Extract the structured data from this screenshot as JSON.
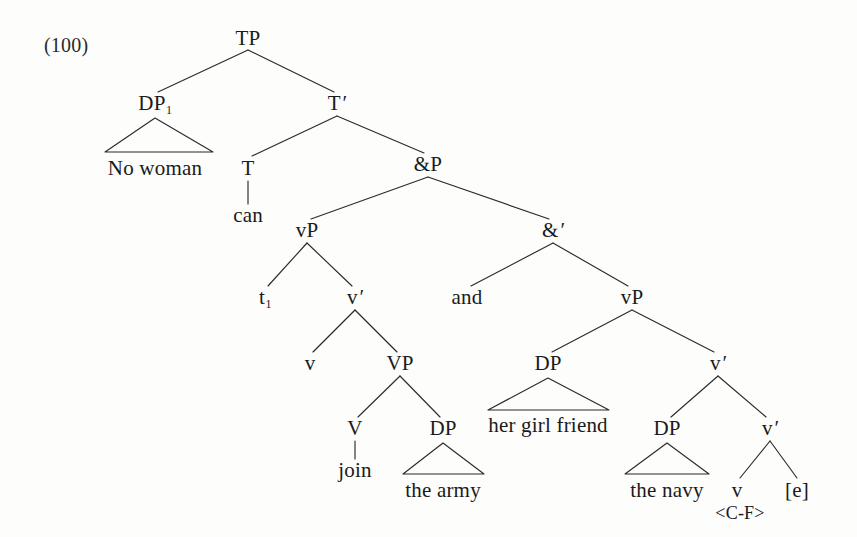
{
  "figure": {
    "example_number": "(100)",
    "kind": "syntax tree",
    "sentence": "No woman can join the army and her girl friend the navy"
  },
  "nodes": {
    "tp": "TP",
    "dp1": "DP",
    "dp1_index": "1",
    "tbar": "T",
    "tbar_prime": "′",
    "t": "T",
    "andp": "&P",
    "vp_left": "vP",
    "andbar": "&",
    "andbar_prime": "′",
    "trace": "t",
    "trace_index": "1",
    "vbar_left": "v",
    "vbar_left_prime": "′",
    "vp_right": "vP",
    "v_left": "v",
    "VP": "VP",
    "V": "V",
    "dp_army": "DP",
    "dp_girlfriend": "DP",
    "vbar_right": "v",
    "vbar_right_prime": "′",
    "dp_navy": "DP",
    "vbar_right2": "v",
    "vbar_right2_prime": "′",
    "v_right": "v",
    "empty_cat": "[e]"
  },
  "terminals": {
    "no_woman": "No woman",
    "can": "can",
    "and": "and",
    "join": "join",
    "the_army": "the army",
    "her_girl_friend": "her girl friend",
    "the_navy": "the navy",
    "contrastive_focus": "<C-F>"
  },
  "colors": {
    "ink": "#1a1a1a",
    "line": "#2b2b2b",
    "paper": "#fdfdfc"
  }
}
